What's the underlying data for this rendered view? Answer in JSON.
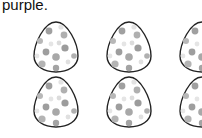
{
  "instruction_fragment": "purple.",
  "worksheet": {
    "egg_count_visible": 6,
    "rows": 2,
    "columns": 3,
    "egg_outline_color": "#222222",
    "dot_colors": [
      "#9a9a9a",
      "#bdbdbd",
      "#e2e2e2"
    ]
  }
}
